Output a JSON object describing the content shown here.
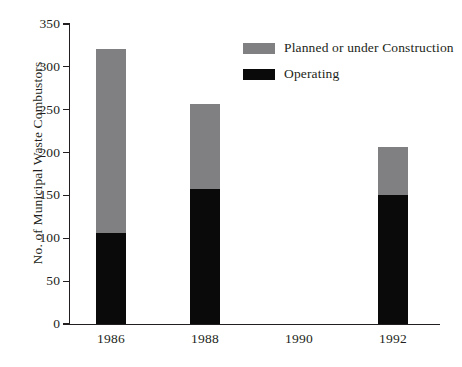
{
  "chart_data": {
    "type": "bar",
    "subtype": "stacked-bar",
    "title": "",
    "xlabel": "",
    "ylabel": "No. of Municipal Waste Combustors",
    "categories": [
      "1986",
      "1988",
      "1990",
      "1992"
    ],
    "series": [
      {
        "name": "Operating",
        "color": "#0a0a0a",
        "values": [
          106,
          157,
          null,
          150
        ]
      },
      {
        "name": "Planned or under Construction",
        "color": "#808083",
        "values": [
          215,
          100,
          null,
          57
        ]
      }
    ],
    "totals": [
      321,
      257,
      null,
      207
    ],
    "ylim": [
      0,
      350
    ],
    "yticks": [
      0,
      50,
      100,
      150,
      200,
      250,
      300,
      350
    ],
    "ytick_labels": [
      "0",
      "50",
      "100",
      "150",
      "200",
      "250",
      "300",
      "350"
    ],
    "grid": false,
    "legend_position": "top-right",
    "legend_entries": [
      {
        "label": "Planned or under Construction",
        "color": "#808083"
      },
      {
        "label": "Operating",
        "color": "#0a0a0a"
      }
    ]
  },
  "axis": {
    "y_title": "No. of Municipal Waste Combustors"
  }
}
